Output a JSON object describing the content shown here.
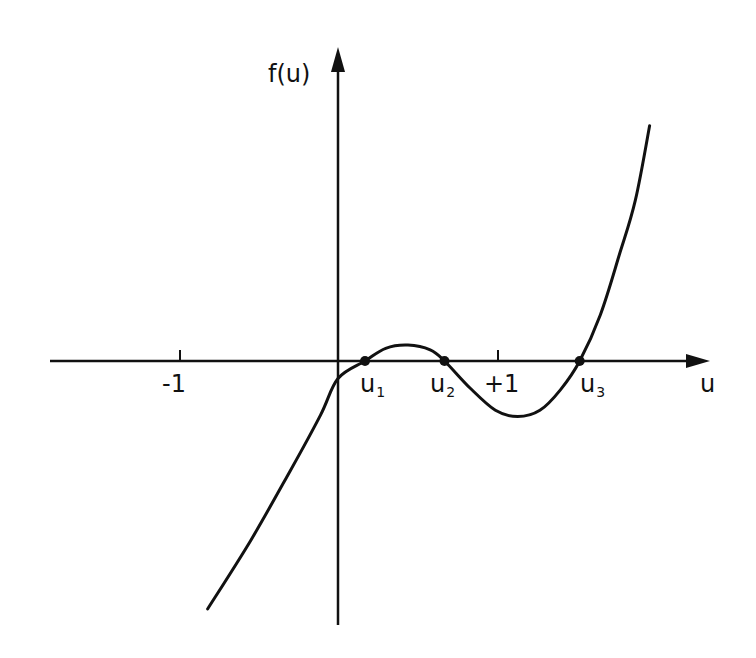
{
  "chart_data": {
    "type": "line",
    "title": "",
    "xlabel": "u",
    "ylabel": "f(u)",
    "x_ticks": [
      {
        "value": -1,
        "label": "-1"
      },
      {
        "value": 1,
        "label": "+1"
      }
    ],
    "roots": [
      {
        "name": "u",
        "sub": "1",
        "x": 0.17
      },
      {
        "name": "u",
        "sub": "2",
        "x": 0.67
      },
      {
        "name": "u",
        "sub": "3",
        "x": 1.52
      }
    ],
    "series": [
      {
        "name": "f(u)",
        "points": [
          [
            -0.82,
            -1.56
          ],
          [
            -0.55,
            -1.13
          ],
          [
            -0.3,
            -0.69
          ],
          [
            -0.11,
            -0.34
          ],
          [
            0.0,
            -0.11
          ],
          [
            0.17,
            0.0
          ],
          [
            0.3,
            0.08
          ],
          [
            0.44,
            0.1
          ],
          [
            0.58,
            0.07
          ],
          [
            0.67,
            0.0
          ],
          [
            0.83,
            -0.17
          ],
          [
            0.99,
            -0.31
          ],
          [
            1.13,
            -0.35
          ],
          [
            1.27,
            -0.31
          ],
          [
            1.4,
            -0.18
          ],
          [
            1.52,
            0.0
          ],
          [
            1.65,
            0.29
          ],
          [
            1.77,
            0.67
          ],
          [
            1.87,
            1.01
          ],
          [
            1.96,
            1.48
          ]
        ]
      }
    ],
    "grid": false,
    "legend": "none"
  },
  "labels": {
    "y_axis": "f(u)",
    "x_axis": "u",
    "tick_neg1": "-1",
    "tick_pos1": "+1",
    "u1": "u",
    "u1_sub": "1",
    "u2": "u",
    "u2_sub": "2",
    "u3": "u",
    "u3_sub": "3"
  },
  "colors": {
    "ink": "#111111",
    "background": "#ffffff"
  }
}
